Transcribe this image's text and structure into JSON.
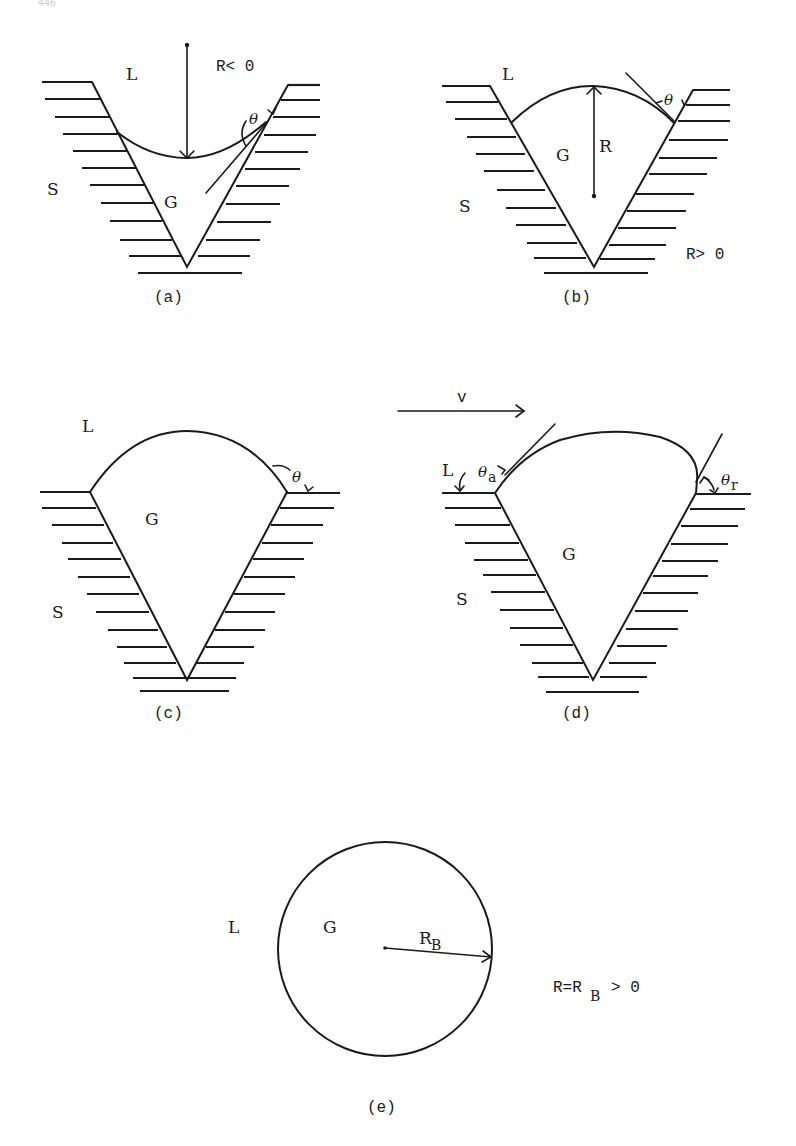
{
  "page": {
    "number_fragment": "446"
  },
  "figure": {
    "panels": [
      {
        "id": "a",
        "caption": "(a)",
        "liquid_label": "L",
        "solid_label": "S",
        "gas_label": "G",
        "radius_condition": "R< 0",
        "angle_label": "θ"
      },
      {
        "id": "b",
        "caption": "(b)",
        "liquid_label": "L",
        "solid_label": "S",
        "gas_label": "G",
        "radius_label": "R",
        "radius_condition": "R> 0",
        "angle_label": "θ"
      },
      {
        "id": "c",
        "caption": "(c)",
        "liquid_label": "L",
        "solid_label": "S",
        "gas_label": "G",
        "angle_label": "θ"
      },
      {
        "id": "d",
        "caption": "(d)",
        "velocity_label": "v",
        "liquid_label": "L",
        "solid_label": "S",
        "gas_label": "G",
        "advancing_angle": {
          "symbol": "θ",
          "subscript": "a"
        },
        "receding_angle": {
          "symbol": "θ",
          "subscript": "r"
        }
      },
      {
        "id": "e",
        "caption": "(e)",
        "liquid_label": "L",
        "gas_label": "G",
        "radius_label": {
          "symbol": "R",
          "subscript": "B"
        },
        "radius_condition": {
          "prefix": "R=R",
          "subscript": "B",
          "suffix": "> 0"
        }
      }
    ]
  }
}
